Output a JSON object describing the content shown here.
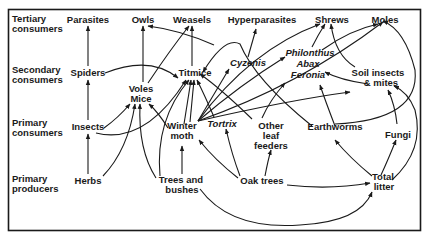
{
  "diagram": {
    "type": "food-web",
    "trophic_levels": [
      {
        "id": "tertiary",
        "line1": "Tertiary",
        "line2": "consumers"
      },
      {
        "id": "secondary",
        "line1": "Secondary",
        "line2": "consumers"
      },
      {
        "id": "primary_consumers",
        "line1": "Primary",
        "line2": "consumers"
      },
      {
        "id": "primary_producers",
        "line1": "Primary",
        "line2": "producers"
      }
    ],
    "nodes": {
      "parasites": "Parasites",
      "owls": "Owls",
      "weasels": "Weasels",
      "hyperparasites": "Hyperparasites",
      "shrews": "Shrews",
      "moles": "Moles",
      "spiders": "Spiders",
      "titmice": "Titmice",
      "cyzenis": "Cyzenis",
      "philonthus": "Philonthus",
      "abax": "Abax",
      "feronia": "Feronia",
      "soil_insects_1": "Soil insects",
      "soil_insects_2": "& mites",
      "voles": "Voles",
      "mice": "Mice",
      "insects": "Insects",
      "winter_moth_1": "Winter",
      "winter_moth_2": "moth",
      "tortrix": "Tortrix",
      "other_leaf_1": "Other",
      "other_leaf_2": "leaf",
      "other_leaf_3": "feeders",
      "earthworms": "Earthworms",
      "fungi": "Fungi",
      "herbs": "Herbs",
      "trees_1": "Trees  and",
      "trees_2": "bushes",
      "oak_trees": "Oak trees",
      "total_litter_1": "Total",
      "total_litter_2": "litter"
    },
    "edges": [
      [
        "Spiders",
        "Parasites"
      ],
      [
        "Insects",
        "Spiders"
      ],
      [
        "Herbs",
        "Insects"
      ],
      [
        "Voles/Mice",
        "Owls"
      ],
      [
        "Voles/Mice",
        "Weasels"
      ],
      [
        "Titmice",
        "Weasels"
      ],
      [
        "Titmice",
        "Owls"
      ],
      [
        "Spiders",
        "Titmice"
      ],
      [
        "Insects",
        "Voles/Mice"
      ],
      [
        "Insects",
        "Titmice"
      ],
      [
        "Herbs",
        "Voles/Mice"
      ],
      [
        "Trees and bushes",
        "Voles/Mice"
      ],
      [
        "Trees and bushes",
        "Titmice"
      ],
      [
        "Trees and bushes",
        "Winter moth"
      ],
      [
        "Winter moth",
        "Titmice"
      ],
      [
        "Winter moth",
        "Voles/Mice"
      ],
      [
        "Winter moth",
        "Cyzenis"
      ],
      [
        "Winter moth",
        "Philonthus/Abax/Feronia"
      ],
      [
        "Winter moth",
        "Moles"
      ],
      [
        "Winter moth",
        "Shrews"
      ],
      [
        "Tortrix",
        "Titmice"
      ],
      [
        "Other leaf feeders",
        "Titmice"
      ],
      [
        "Cyzenis",
        "Hyperparasites"
      ],
      [
        "Oak trees",
        "Winter moth"
      ],
      [
        "Oak trees",
        "Tortrix"
      ],
      [
        "Oak trees",
        "Other leaf feeders"
      ],
      [
        "Oak trees",
        "Total litter"
      ],
      [
        "Trees and bushes",
        "Total litter"
      ],
      [
        "Total litter",
        "Earthworms"
      ],
      [
        "Total litter",
        "Fungi"
      ],
      [
        "Total litter",
        "Soil insects & mites"
      ],
      [
        "Fungi",
        "Soil insects & mites"
      ],
      [
        "Earthworms",
        "Moles"
      ],
      [
        "Earthworms",
        "Philonthus/Abax/Feronia"
      ],
      [
        "Earthworms",
        "Titmice"
      ],
      [
        "Soil insects & mites",
        "Shrews"
      ],
      [
        "Soil insects & mites",
        "Feronia"
      ],
      [
        "Philonthus/Abax/Feronia",
        "Shrews"
      ],
      [
        "Philonthus/Abax/Feronia",
        "Moles"
      ],
      [
        "Moles",
        "Owls"
      ]
    ]
  }
}
